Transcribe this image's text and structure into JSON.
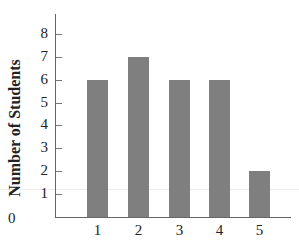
{
  "chart_data": {
    "type": "bar",
    "title": "",
    "xlabel": "",
    "ylabel": "Number of Students",
    "categories": [
      "1",
      "2",
      "3",
      "4",
      "5"
    ],
    "values": [
      6,
      7,
      6,
      6,
      2
    ],
    "ylim": [
      0,
      8
    ],
    "yticks": [
      "1",
      "2",
      "3",
      "4",
      "5",
      "6",
      "7",
      "8"
    ],
    "origin_label": "0",
    "grid": false,
    "legend": null,
    "bar_color": "#7f7f7f"
  }
}
